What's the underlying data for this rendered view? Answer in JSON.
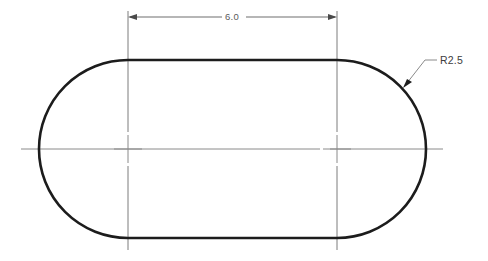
{
  "drawing": {
    "title": "Obround Slot Profile",
    "type": "2d-engineering-drawing",
    "background_color": "#ffffff",
    "outline_color": "#1c1c1c",
    "centerline_color": "#8a8a8a",
    "dimension_color": "#5a5a5a"
  },
  "shape": {
    "name": "obround-slot",
    "left_center_x": 128,
    "left_center_y": 149,
    "right_center_x": 337,
    "right_center_y": 149,
    "radius_px": 89,
    "top_y": 60,
    "bottom_y": 238,
    "left_extreme_x": 39,
    "right_extreme_x": 426,
    "outline_path": "M 128 60 L 337 60 A 89 89 0 0 1 337 238 L 128 238 A 89 89 0 0 1 128 60 Z"
  },
  "dimensions": {
    "length": {
      "label": "6.0",
      "value": 6.0,
      "type": "linear-horizontal",
      "from_x": 128,
      "to_x": 337,
      "dim_line_y": 17,
      "text_x": 232,
      "text_y": 20,
      "text_gap_left": 222,
      "text_gap_right": 246,
      "extension_top_y": 11,
      "extension_bottom_y": 250
    },
    "radius": {
      "label": "R2.5",
      "value": 2.5,
      "type": "radius-leader",
      "arrow_x": 404,
      "arrow_y": 86,
      "elbow_x": 425,
      "elbow_y": 60,
      "shelf_end_x": 437,
      "shelf_y": 60,
      "text_x": 440,
      "text_y": 64
    }
  },
  "centerlines": {
    "horizontal": {
      "y": 149,
      "start_x": 21,
      "end_x": 443,
      "gap_start_x": 320,
      "gap_end_x": 330
    },
    "left_center_mark": {
      "x": 128,
      "y": 149,
      "half_len_h": 14,
      "half_len_v": 14
    },
    "right_center_mark": {
      "x": 337,
      "y": 149,
      "half_len_h": 14,
      "half_len_v": 14
    }
  }
}
